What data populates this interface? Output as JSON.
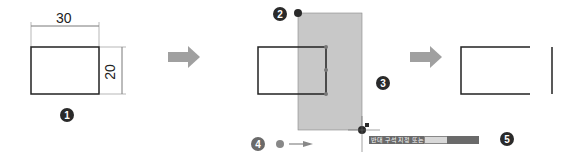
{
  "step1": {
    "width_label": "30",
    "height_label": "20",
    "marker": "1"
  },
  "step2": {
    "marker": "2"
  },
  "step3": {
    "marker": "3"
  },
  "step4": {
    "marker": "4"
  },
  "step5": {
    "marker": "5"
  },
  "tooltip": {
    "prompt": "반대 구석 지정 또는",
    "field1": "",
    "field2": ""
  },
  "colors": {
    "selection_fill": "#c8c8c8",
    "arrow": "#9a9a9a",
    "marker_dark": "#2a2a2a"
  }
}
